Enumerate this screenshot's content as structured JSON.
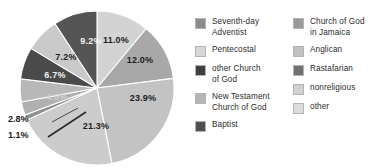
{
  "chart_data": {
    "type": "pie",
    "title": "",
    "subtitle": "",
    "xlabel": "",
    "ylabel": "",
    "legend_position": "right",
    "grid": false,
    "value_suffix": "%",
    "start_angle_deg": 0,
    "direction": "clockwise",
    "categories": [
      "Seventh-day Adventist",
      "Church of God in Jamaica",
      "Pentecostal",
      "Anglican",
      "other Church of God",
      "Rastafarian",
      "New Testament Church of God",
      "nonreligious",
      "Baptist",
      "other"
    ],
    "values": [
      11.0,
      12.0,
      23.9,
      21.3,
      1.1,
      2.8,
      4.8,
      6.7,
      7.2,
      9.2
    ],
    "slices": [
      {
        "label": "11.0%",
        "value": 11.0,
        "color": "#d3d3d3",
        "label_color": "on-light",
        "placement": "inside",
        "lx": 116,
        "ly": 40
      },
      {
        "label": "12.0%",
        "value": 12.0,
        "color": "#a8a8a8",
        "label_color": "on-light",
        "placement": "inside",
        "lx": 140,
        "ly": 60
      },
      {
        "label": "23.9%",
        "value": 23.9,
        "color": "#c3c3c3",
        "label_color": "on-light",
        "placement": "inside",
        "lx": 143,
        "ly": 98
      },
      {
        "label": "21.3%",
        "value": 21.3,
        "color": "#cccccc",
        "label_color": "on-light",
        "placement": "inside",
        "lx": 96,
        "ly": 126
      },
      {
        "label": "1.1%",
        "value": 1.1,
        "color": "#8f8f8f",
        "label_color": "on-light",
        "placement": "outside",
        "lx": 8,
        "ly": 135
      },
      {
        "label": "2.8%",
        "value": 2.8,
        "color": "#b0b0b0",
        "label_color": "on-light",
        "placement": "outside",
        "lx": 8,
        "ly": 119
      },
      {
        "label": "4.8%",
        "value": 4.8,
        "color": "#b8b8b8",
        "label_color": "faint",
        "placement": "inside",
        "lx": 57,
        "ly": 97
      },
      {
        "label": "6.7%",
        "value": 6.7,
        "color": "#4a4a4a",
        "label_color": "on-dark",
        "placement": "inside",
        "lx": 55,
        "ly": 75
      },
      {
        "label": "7.2%",
        "value": 7.2,
        "color": "#c9c9c9",
        "label_color": "on-light",
        "placement": "inside",
        "lx": 66,
        "ly": 57
      },
      {
        "label": "9.2%",
        "value": 9.2,
        "color": "#555555",
        "label_color": "on-dark",
        "placement": "inside",
        "lx": 91,
        "ly": 41
      }
    ],
    "legend": {
      "columns": [
        {
          "items": [
            {
              "label": "Seventh-day\nAdventist",
              "color": "#8c8c8c"
            },
            {
              "label": "Pentecostal",
              "color": "#d8d8d8"
            },
            {
              "label": "other Church\nof God",
              "color": "#3f3f3f"
            },
            {
              "label": "New Testament\nChurch of God",
              "color": "#b5b5b5"
            },
            {
              "label": "Baptist",
              "color": "#4f4f4f"
            }
          ]
        },
        {
          "items": [
            {
              "label": "Church of God\nin Jamaica",
              "color": "#9a9a9a"
            },
            {
              "label": "Anglican",
              "color": "#c0c0c0"
            },
            {
              "label": "Rastafarian",
              "color": "#707070"
            },
            {
              "label": "nonreligious",
              "color": "#d0d0d0"
            },
            {
              "label": "other",
              "color": "#dcdcdc"
            }
          ]
        }
      ]
    }
  }
}
